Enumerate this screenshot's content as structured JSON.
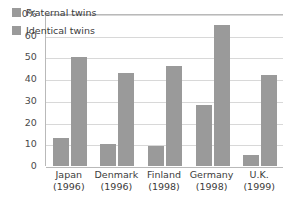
{
  "chart_data": {
    "type": "bar",
    "title": "",
    "subtitle": "",
    "xlabel": "",
    "ylabel": "",
    "ylim": [
      0,
      70
    ],
    "ytick_values": [
      0,
      10,
      20,
      30,
      40,
      50,
      60,
      70
    ],
    "ytick_labels": [
      "0",
      "10",
      "20",
      "30",
      "40",
      "50",
      "60",
      "70%"
    ],
    "grid": true,
    "legend_position": "top-left",
    "categories": [
      "Japan",
      "Denmark",
      "Finland",
      "Germany",
      "U.K."
    ],
    "category_years": [
      "(1996)",
      "(1996)",
      "(1998)",
      "(1998)",
      "(1999)"
    ],
    "series": [
      {
        "name": "Fraternal twins",
        "color": "#9a9a9a",
        "values": [
          13,
          10,
          9,
          28,
          5
        ]
      },
      {
        "name": "Identical twins",
        "color": "#9a9a9a",
        "values": [
          50,
          43,
          46,
          65,
          42
        ]
      }
    ],
    "colors": {
      "bar": "#9a9a9a",
      "gridline": "#d8d8d8",
      "axis": "#b9b9b9",
      "text": "#3b3b3b",
      "background": "#ffffff"
    }
  },
  "legend": {
    "items": [
      {
        "label": "Fraternal twins"
      },
      {
        "label": "Identical twins"
      }
    ]
  },
  "y_axis": {
    "ticks": [
      {
        "label": "70%",
        "value": 70
      },
      {
        "label": "60",
        "value": 60
      },
      {
        "label": "50",
        "value": 50
      },
      {
        "label": "40",
        "value": 40
      },
      {
        "label": "30",
        "value": 30
      },
      {
        "label": "20",
        "value": 20
      },
      {
        "label": "10",
        "value": 10
      },
      {
        "label": "0",
        "value": 0
      }
    ]
  },
  "x_axis": {
    "categories": [
      {
        "name": "Japan",
        "year": "(1996)"
      },
      {
        "name": "Denmark",
        "year": "(1996)"
      },
      {
        "name": "Finland",
        "year": "(1998)"
      },
      {
        "name": "Germany",
        "year": "(1998)"
      },
      {
        "name": "U.K.",
        "year": "(1999)"
      }
    ]
  }
}
